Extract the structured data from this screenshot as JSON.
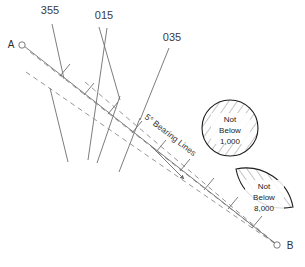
{
  "diagram": {
    "background_color": "#ffffff",
    "line_color": "#6e6e6e",
    "dash_color": "#8a8a8a",
    "text_color": "#3a3a3a",
    "points": [
      {
        "id": "A",
        "label": "A",
        "x": 22,
        "y": 45,
        "label_x": 11,
        "label_y": 48
      },
      {
        "id": "B",
        "label": "B",
        "x": 277,
        "y": 245,
        "label_x": 289,
        "label_y": 249
      }
    ],
    "bearing_labels": [
      {
        "label": "355",
        "x": 50,
        "y": 14
      },
      {
        "label": "015",
        "x": 104,
        "y": 19
      },
      {
        "label": "035",
        "x": 172,
        "y": 41
      }
    ],
    "annotation": {
      "bearing_lines_label": "5° Bearing Lines",
      "rotation_deg": 38
    },
    "symbols": [
      {
        "id": "circle-1000",
        "shape": "circle",
        "text_lines": [
          "Not",
          "Below",
          "1,000"
        ],
        "cx": 230,
        "cy": 128,
        "r": 28
      },
      {
        "id": "lens-8000",
        "shape": "lens",
        "text_lines": [
          "Not",
          "Below",
          "8,000"
        ],
        "cx": 264,
        "cy": 195,
        "rx": 31,
        "ry": 27
      }
    ],
    "legend_note": ""
  }
}
